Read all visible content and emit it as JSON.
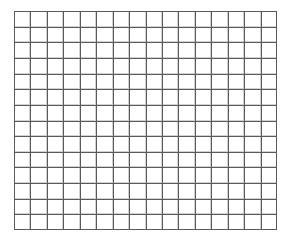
{
  "canvas": {
    "width": 290,
    "height": 245,
    "background": "#ffffff"
  },
  "chart_data": {
    "type": "grid",
    "title": "",
    "subtitle": "",
    "xlabel": "",
    "ylabel": "",
    "series": [],
    "categories": [],
    "values": [],
    "annotations": [],
    "legend": {
      "visible": false,
      "position": "none",
      "entries": []
    },
    "axes": {
      "x": {
        "visible_ticks": false,
        "tick_labels": [],
        "range": [
          0,
          16
        ]
      },
      "y": {
        "visible_ticks": false,
        "tick_labels": [],
        "range": [
          0,
          14
        ]
      }
    },
    "grid": {
      "visible": true,
      "columns": 16,
      "rows": 14,
      "cell_width": 16.4,
      "cell_height": 15.6,
      "line_color_major": "#5a5a5a",
      "line_color_minor": "#d2d2d2",
      "line_width": 1
    }
  },
  "plot": {
    "origin_x": 14,
    "origin_y": 11,
    "width": 263,
    "height": 219,
    "border_color": "#5a5a5a"
  },
  "status": {
    "empty_message": ""
  }
}
